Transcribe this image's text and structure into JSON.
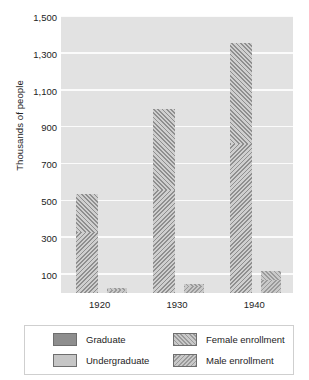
{
  "chart_data": {
    "type": "bar",
    "title": "",
    "xlabel": "",
    "ylabel": "Thousands of people",
    "categories": [
      "1920",
      "1930",
      "1940"
    ],
    "ylim": [
      0,
      1500
    ],
    "yticks": [
      1500,
      1300,
      1100,
      900,
      700,
      500,
      300,
      100
    ],
    "ytick_labels": [
      "1,500",
      "1,300",
      "1,100",
      "900",
      "700",
      "500",
      "300",
      "100"
    ],
    "grid": true,
    "legend_position": "bottom",
    "stacked": true,
    "groups": [
      {
        "name": "Undergraduate",
        "series": [
          {
            "name": "Male enrollment",
            "values": [
              330,
              560,
              810
            ]
          },
          {
            "name": "Female enrollment",
            "values": [
              210,
              440,
              550
            ]
          }
        ],
        "totals": [
          540,
          1000,
          1360
        ]
      },
      {
        "name": "Graduate",
        "series": [
          {
            "name": "Male enrollment",
            "values": [
              16,
              30,
              70
            ]
          },
          {
            "name": "Female enrollment",
            "values": [
              9,
              20,
              50
            ]
          }
        ],
        "totals": [
          25,
          50,
          120
        ]
      }
    ],
    "legend": [
      {
        "label": "Graduate",
        "swatch": "solid-dark"
      },
      {
        "label": "Undergraduate",
        "swatch": "solid-light"
      },
      {
        "label": "Female enrollment",
        "swatch": "hatch-forward"
      },
      {
        "label": "Male enrollment",
        "swatch": "hatch-back"
      }
    ],
    "colors": {
      "plot_background": "#e2e2e2",
      "gridline": "#fbfbfb",
      "graduate": "#8e8e8e",
      "undergraduate": "#c6c6c6",
      "hatch_dark": "#9a9a9a",
      "hatch_light": "#c9c9c9",
      "text": "#1d1d1d"
    }
  }
}
